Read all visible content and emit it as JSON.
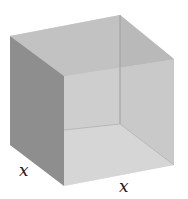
{
  "diagram": {
    "type": "open-top cube (box) in oblique perspective",
    "labels": [
      {
        "id": "depth-label",
        "text": "x"
      },
      {
        "id": "width-label",
        "text": "x"
      }
    ],
    "colors": {
      "left_outer_face": "#8c8c8c",
      "back_inner_face": "#b9b9b9",
      "right_inner_face": "#a4a4a4",
      "front_face": "#d2d2d2",
      "floor": "#dddddd",
      "top_face_tint": "#c4c4c4",
      "edge": "#9a9a9a",
      "background": "#ffffff"
    }
  }
}
